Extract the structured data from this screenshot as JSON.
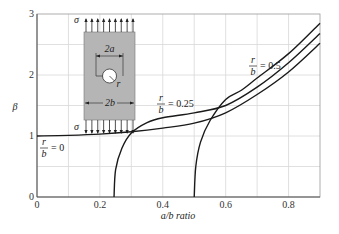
{
  "chart_data": {
    "type": "line",
    "title": "",
    "xlabel": "a/b ratio",
    "ylabel": "β",
    "xlim": [
      0,
      0.9
    ],
    "ylim": [
      0,
      3
    ],
    "grid": true,
    "x_ticks": [
      "0",
      "0.2",
      "0.4",
      "0.6",
      "0.8"
    ],
    "y_ticks": [
      "0",
      "1",
      "2",
      "3"
    ],
    "series": [
      {
        "name": "r/b = 0",
        "label_num": "r",
        "label_den": "b",
        "label_val": "= 0",
        "x": [
          0,
          0.1,
          0.2,
          0.3,
          0.4,
          0.5,
          0.6,
          0.7,
          0.8,
          0.9
        ],
        "y": [
          1.0,
          1.01,
          1.03,
          1.07,
          1.13,
          1.21,
          1.38,
          1.68,
          2.05,
          2.52
        ]
      },
      {
        "name": "r/b = 0.25",
        "label_num": "r",
        "label_den": "b",
        "label_val": "= 0.25",
        "x": [
          0.245,
          0.25,
          0.27,
          0.3,
          0.35,
          0.4,
          0.5,
          0.6,
          0.7,
          0.8,
          0.9
        ],
        "y": [
          0.0,
          0.45,
          0.8,
          1.05,
          1.22,
          1.3,
          1.38,
          1.5,
          1.8,
          2.2,
          2.68
        ]
      },
      {
        "name": "r/b = 0.5",
        "label_num": "r",
        "label_den": "b",
        "label_val": "= 0.5",
        "x": [
          0.5,
          0.505,
          0.52,
          0.55,
          0.6,
          0.65,
          0.7,
          0.8,
          0.9
        ],
        "y": [
          0.0,
          0.5,
          0.9,
          1.25,
          1.6,
          1.75,
          1.95,
          2.35,
          2.85
        ]
      }
    ],
    "inset": {
      "stress_symbol": "σ",
      "hole_width_label": "2a",
      "plate_width_label": "2b",
      "radius_label": "r"
    }
  }
}
